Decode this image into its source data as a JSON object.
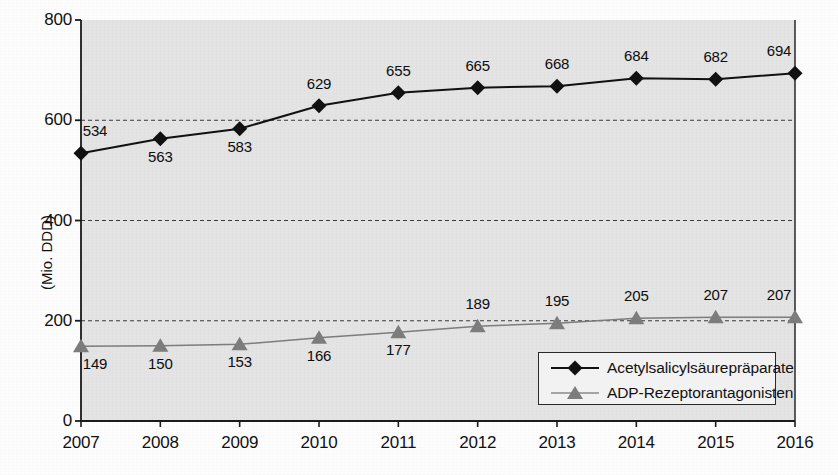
{
  "chart_data": {
    "type": "line",
    "title": "",
    "xlabel": "",
    "ylabel": "(Mio. DDD)",
    "categories": [
      "2007",
      "2008",
      "2009",
      "2010",
      "2011",
      "2012",
      "2013",
      "2014",
      "2015",
      "2016"
    ],
    "ylim": [
      0,
      800
    ],
    "yticks": [
      "0",
      "200",
      "400",
      "600",
      "800"
    ],
    "ytick_values": [
      0,
      200,
      400,
      600,
      800
    ],
    "grid": "horizontal-dashed",
    "legend_position": "bottom-right",
    "series": [
      {
        "name": "Acetylsalicylsäurepräparate",
        "marker": "diamond",
        "color": "#111111",
        "values": [
          534,
          563,
          583,
          629,
          655,
          665,
          668,
          684,
          682,
          694
        ],
        "labels": [
          "534",
          "563",
          "583",
          "629",
          "655",
          "665",
          "668",
          "684",
          "682",
          "694"
        ],
        "label_side": [
          "above",
          "below",
          "below",
          "above",
          "above",
          "above",
          "above",
          "above",
          "above",
          "above"
        ]
      },
      {
        "name": "ADP-Rezeptorantagonisten",
        "marker": "triangle",
        "color": "#7d7d7d",
        "values": [
          149,
          150,
          153,
          166,
          177,
          189,
          195,
          205,
          207,
          207
        ],
        "labels": [
          "149",
          "150",
          "153",
          "166",
          "177",
          "189",
          "195",
          "205",
          "207",
          "207"
        ],
        "label_side": [
          "below",
          "below",
          "below",
          "below",
          "below",
          "above",
          "above",
          "above",
          "above",
          "above"
        ]
      }
    ]
  },
  "legend": {
    "items": [
      {
        "label": "Acetylsalicylsäurepräparate",
        "marker": "diamond-marker",
        "color": "#111111"
      },
      {
        "label": "ADP-Rezeptorantagonisten",
        "marker": "triangle-marker",
        "color": "#7d7d7d"
      }
    ]
  },
  "colors": {
    "plot_background": "#e4e4e4",
    "axis": "#1a1a1a",
    "gridline": "#3a3a3a",
    "series_primary": "#111111",
    "series_secondary": "#7d7d7d"
  }
}
